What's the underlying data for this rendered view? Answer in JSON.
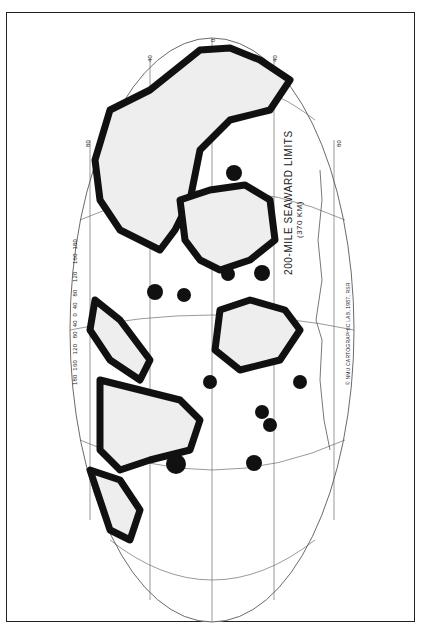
{
  "map": {
    "title": "200-MILE SEAWARD LIMITS",
    "subtitle": "(370 KM)",
    "credit": "© NMU CARTOGRAPHIC LAB, 1987, RSR",
    "projection": "oval (rotated 90°)",
    "colors": {
      "zones": "#111111",
      "land": "#eeeeee",
      "graticule": "#555555",
      "background": "#ffffff"
    },
    "longitude_labels_left": [
      "180",
      "160",
      "120",
      "80",
      "40",
      "0",
      "40",
      "80",
      "120",
      "160",
      "180"
    ],
    "latitude_labels_top": [
      "0",
      "40",
      "40",
      "80",
      "80"
    ]
  }
}
